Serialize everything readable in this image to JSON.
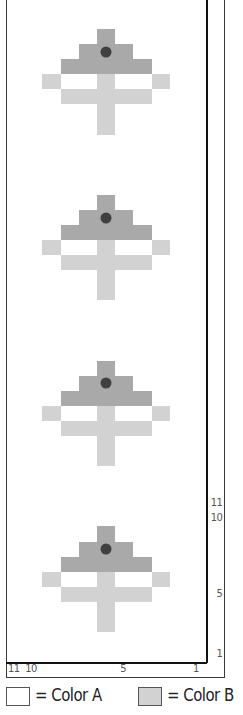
{
  "chart": {
    "columns": 11,
    "rows": 44,
    "repeat_rows": 11,
    "cell_width": 18.2,
    "cell_height": 15.07,
    "colors": {
      "A": "#ffffff",
      "B_light": "#d2d2d2",
      "B_dark": "#a9a9a9",
      "dot": "#404040",
      "grid_line": "#3a3a3a"
    },
    "motif_rows_from_bottom_of_repeat": [
      {
        "row": 3,
        "light": [
          5
        ],
        "dark": [],
        "dot": []
      },
      {
        "row": 4,
        "light": [
          5
        ],
        "dark": [],
        "dot": []
      },
      {
        "row": 5,
        "light": [
          3,
          4,
          5,
          6,
          7
        ],
        "dark": [],
        "dot": []
      },
      {
        "row": 6,
        "light": [
          2,
          5,
          8
        ],
        "dark": [],
        "dot": []
      },
      {
        "row": 7,
        "light": [],
        "dark": [
          3,
          4,
          5,
          6,
          7
        ],
        "dot": []
      },
      {
        "row": 8,
        "light": [],
        "dark": [
          4,
          5,
          6
        ],
        "dot": [
          5
        ]
      },
      {
        "row": 9,
        "light": [],
        "dark": [
          5
        ],
        "dot": []
      }
    ],
    "row_labels": [
      {
        "row": 1,
        "text": "1"
      },
      {
        "row": 5,
        "text": "5"
      },
      {
        "row": 10,
        "text": "10"
      },
      {
        "row": 11,
        "text": "11"
      }
    ],
    "column_labels": [
      {
        "col": 0,
        "text": "11"
      },
      {
        "col": 1,
        "text": "10"
      },
      {
        "col": 6,
        "text": "5"
      },
      {
        "col": 10,
        "text": "1"
      }
    ]
  },
  "legend": {
    "items": [
      {
        "swatch": "#ffffff",
        "label": "= Color A"
      },
      {
        "swatch": "#d2d2d2",
        "label": "= Color B"
      }
    ]
  }
}
